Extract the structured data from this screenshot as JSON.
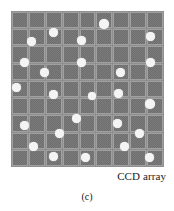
{
  "figure": {
    "caption": "(c)",
    "array_label": "CCD array",
    "colors": {
      "page_background": "#ffffff",
      "grid_background": "#8f8f8f",
      "cell_fill": "#7b7b7b",
      "cell_pattern": "#6e6e6e",
      "cell_border": "#a0a0a0",
      "dot_fill": "#f4f4f4",
      "text": "#1a1a1a"
    }
  },
  "ccd_array": {
    "name": "CCD array",
    "columns": 9,
    "rows": 9,
    "cell_count": 81,
    "dot_count": 31,
    "dot_diameter_px": 9,
    "dots": [
      {
        "x": 88,
        "y": 8,
        "d": 10
      },
      {
        "x": 38,
        "y": 17,
        "d": 9
      },
      {
        "x": 135,
        "y": 21,
        "d": 9
      },
      {
        "x": 16,
        "y": 26,
        "d": 9
      },
      {
        "x": 66,
        "y": 25,
        "d": 9
      },
      {
        "x": 9,
        "y": 47,
        "d": 9
      },
      {
        "x": 66,
        "y": 47,
        "d": 9
      },
      {
        "x": 135,
        "y": 47,
        "d": 9
      },
      {
        "x": 29,
        "y": 57,
        "d": 9
      },
      {
        "x": 105,
        "y": 57,
        "d": 9
      },
      {
        "x": 1,
        "y": 72,
        "d": 9
      },
      {
        "x": 38,
        "y": 79,
        "d": 9
      },
      {
        "x": 77,
        "y": 81,
        "d": 8
      },
      {
        "x": 103,
        "y": 78,
        "d": 9
      },
      {
        "x": 134,
        "y": 88,
        "d": 10
      },
      {
        "x": 61,
        "y": 103,
        "d": 9
      },
      {
        "x": 9,
        "y": 110,
        "d": 9
      },
      {
        "x": 102,
        "y": 108,
        "d": 9
      },
      {
        "x": 44,
        "y": 118,
        "d": 9
      },
      {
        "x": 124,
        "y": 118,
        "d": 9
      },
      {
        "x": 18,
        "y": 131,
        "d": 9
      },
      {
        "x": 109,
        "y": 131,
        "d": 9
      },
      {
        "x": 38,
        "y": 141,
        "d": 9
      },
      {
        "x": 70,
        "y": 142,
        "d": 9
      },
      {
        "x": 134,
        "y": 142,
        "d": 9
      }
    ]
  }
}
